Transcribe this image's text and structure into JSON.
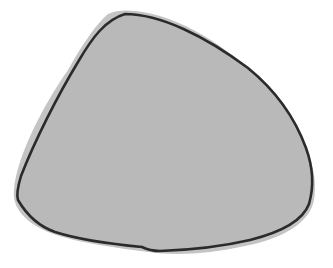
{
  "image": {
    "width": 333,
    "height": 268,
    "background": "#ffffff"
  },
  "shape": {
    "kind": "rounded-triangle-blob",
    "fill_color": "#b9b9b9",
    "halo_color": "#c4c4c4",
    "outline_color": "#2b2b2b",
    "outline_width": 2.6,
    "halo_path": "M 108 14 C 120 8, 140 10, 160 16 C 205 30, 255 65, 290 120 C 310 150, 318 175, 314 200 C 310 222, 285 238, 245 246 C 210 254, 175 256, 148 252 C 120 248, 80 244, 48 232 C 25 222, 12 208, 14 190 C 16 160, 40 110, 68 70 C 82 45, 96 24, 108 14 Z",
    "outline_path": "M 125 14 C 160 14, 205 36, 248 68 C 275 90, 295 118, 306 148 C 314 170, 313 190, 309 204 C 303 220, 282 232, 250 240 C 220 247, 190 250, 160 251 C 150 251, 146 249, 142 247 C 110 244, 80 240, 55 232 C 35 225, 25 212, 18 200 C 16 194, 18 186, 21 176 C 35 140, 58 95, 78 62 C 92 38, 105 20, 125 14 Z"
  }
}
